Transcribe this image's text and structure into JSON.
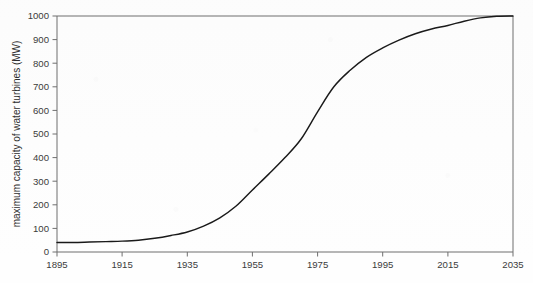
{
  "chart_data": {
    "type": "line",
    "title": "",
    "subtitle": "",
    "xlabel": "",
    "ylabel": "maximum capacity of water turbines (MW)",
    "xlim": [
      1895,
      2035
    ],
    "ylim": [
      0,
      1000
    ],
    "grid": false,
    "legend_position": "none",
    "x_ticks": [
      "1895",
      "1915",
      "1935",
      "1955",
      "1975",
      "1995",
      "2015",
      "2035"
    ],
    "y_ticks": [
      "0",
      "100",
      "200",
      "300",
      "400",
      "500",
      "600",
      "700",
      "800",
      "900",
      "1000"
    ],
    "x_tick_values": [
      1895,
      1915,
      1935,
      1955,
      1975,
      1995,
      2015,
      2035
    ],
    "y_tick_values": [
      0,
      100,
      200,
      300,
      400,
      500,
      600,
      700,
      800,
      900,
      1000
    ],
    "series": [
      {
        "name": "maximum capacity of water turbines",
        "color": "#1a1a1a",
        "x": [
          1895,
          1900,
          1905,
          1910,
          1915,
          1920,
          1925,
          1930,
          1935,
          1940,
          1945,
          1950,
          1955,
          1960,
          1965,
          1970,
          1975,
          1980,
          1985,
          1990,
          1995,
          2000,
          2005,
          2010,
          2015,
          2020,
          2025,
          2030,
          2035
        ],
        "values": [
          40,
          40,
          42,
          44,
          46,
          50,
          58,
          70,
          85,
          110,
          145,
          195,
          263,
          330,
          400,
          480,
          594,
          700,
          770,
          825,
          865,
          898,
          925,
          945,
          960,
          978,
          992,
          999,
          1000
        ]
      }
    ],
    "annotations": []
  },
  "axis": {
    "y_title": "maximum capacity of water turbines (MW)"
  },
  "colors": {
    "curve": "#1a1a1a",
    "frame": "#6f6f6f",
    "text": "#3b3b3b",
    "background": "#fefefe"
  }
}
